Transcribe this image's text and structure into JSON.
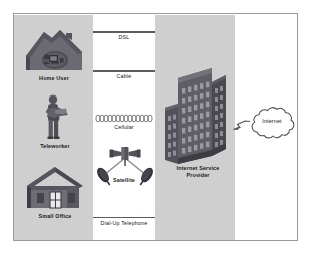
{
  "diagram": {
    "bands": {
      "access_band_name": "customer access band",
      "isp_band_name": "internet service provider band",
      "band_color": "#cfcfcf"
    },
    "nodes": [
      {
        "id": "home-user",
        "label": "Home User",
        "icon": "house-with-computer-icon"
      },
      {
        "id": "teleworker",
        "label": "Teleworker",
        "icon": "person-with-laptop-icon"
      },
      {
        "id": "small-office",
        "label": "Small Office",
        "icon": "small-office-building-icon"
      },
      {
        "id": "isp",
        "label": "Internet Service\nProvider",
        "icon": "office-tower-icon"
      },
      {
        "id": "internet",
        "label": "Internet",
        "icon": "cloud-icon"
      }
    ],
    "links": [
      {
        "id": "dsl",
        "label": "DSL",
        "style": "solid-line"
      },
      {
        "id": "cable",
        "label": "Cable",
        "style": "solid-line"
      },
      {
        "id": "cellular",
        "label": "Cellular",
        "style": "coil-loops"
      },
      {
        "id": "satellite",
        "label": "Satellite",
        "style": "satellite-dishes"
      },
      {
        "id": "dialup",
        "label": "Dial-Up Telephone",
        "style": "solid-line"
      }
    ],
    "colors": {
      "frame_border": "#9a9a9a",
      "line": "#5c5c5c",
      "icon_dark": "#55535a",
      "icon_mid": "#6e6c74",
      "icon_light": "#8b8992",
      "text": "#1a1a1a"
    }
  }
}
